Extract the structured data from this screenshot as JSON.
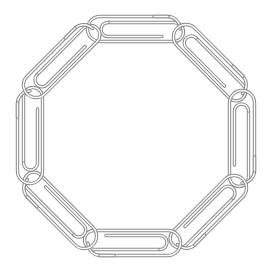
{
  "image": {
    "subject": "Ring of eight interlinked paperclips forming an octagon",
    "background": "#ffffff",
    "wire_color": "#8a8a8a",
    "wire_highlight": "#d9d9d9",
    "clip_count": 8,
    "clips": [
      {
        "id": "top",
        "cx": 134,
        "cy": 29,
        "angle": 0
      },
      {
        "id": "top-right",
        "cx": 210,
        "cy": 61,
        "angle": 45
      },
      {
        "id": "right",
        "cx": 242,
        "cy": 137,
        "angle": 90
      },
      {
        "id": "bottom-right",
        "cx": 210,
        "cy": 212,
        "angle": 135
      },
      {
        "id": "bottom",
        "cx": 134,
        "cy": 243,
        "angle": 180
      },
      {
        "id": "bottom-left",
        "cx": 60,
        "cy": 212,
        "angle": 225
      },
      {
        "id": "left",
        "cx": 30,
        "cy": 137,
        "angle": 270
      },
      {
        "id": "top-left",
        "cx": 60,
        "cy": 61,
        "angle": 315
      }
    ]
  }
}
